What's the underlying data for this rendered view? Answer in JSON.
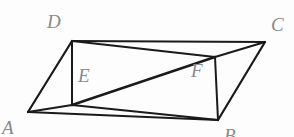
{
  "figure": {
    "kind": "geometry-diagram",
    "background_color": "#fdfdfd",
    "stroke_color": "#1a1a1a",
    "label_color": "#8a8a8a",
    "width": 294,
    "height": 137,
    "labels": {
      "a": "A",
      "b": "B",
      "c": "C",
      "d": "D",
      "e": "E",
      "f": "F"
    },
    "points": {
      "A": {
        "x": 28,
        "y": 112
      },
      "B": {
        "x": 218,
        "y": 120
      },
      "C": {
        "x": 265,
        "y": 42
      },
      "D": {
        "x": 72,
        "y": 41
      },
      "E": {
        "x": 72,
        "y": 105
      },
      "F": {
        "x": 215,
        "y": 57
      }
    },
    "segments": [
      {
        "name": "side-DC",
        "from": "D",
        "to": "C",
        "width": 2.2
      },
      {
        "name": "side-AB",
        "from": "A",
        "to": "B",
        "width": 2.2
      },
      {
        "name": "side-AD",
        "from": "A",
        "to": "D",
        "width": 2.2
      },
      {
        "name": "side-BC",
        "from": "B",
        "to": "C",
        "width": 2.2
      },
      {
        "name": "segment-DE",
        "from": "D",
        "to": "E",
        "width": 2.0
      },
      {
        "name": "segment-FB",
        "from": "F",
        "to": "B",
        "width": 2.0
      },
      {
        "name": "segment-AE",
        "from": "A",
        "to": "E",
        "width": 2.0
      },
      {
        "name": "segment-EB",
        "from": "E",
        "to": "B",
        "width": 2.0
      },
      {
        "name": "segment-EF",
        "from": "E",
        "to": "F",
        "width": 2.4
      },
      {
        "name": "segment-DF",
        "from": "D",
        "to": "F",
        "width": 2.0
      },
      {
        "name": "segment-FC",
        "from": "F",
        "to": "C",
        "width": 2.0
      }
    ]
  }
}
